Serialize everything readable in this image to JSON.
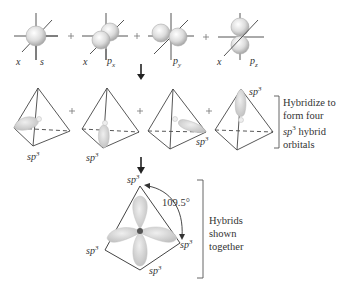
{
  "row1": {
    "orbitals": [
      {
        "axis_label": "x",
        "orbital_label": "s"
      },
      {
        "axis_label": "x",
        "orbital_label": "p",
        "orbital_sub": "x"
      },
      {
        "axis_label": "",
        "orbital_label": "p",
        "orbital_sub": "y"
      },
      {
        "axis_label": "x",
        "orbital_label": "p",
        "orbital_sub": "z"
      }
    ],
    "operator": "+"
  },
  "row2": {
    "hybrid_label": "sp",
    "hybrid_sup": "3",
    "operator": "+",
    "bracket_text": {
      "line1": "Hybridize to",
      "line2": "form four",
      "line3_italic": "sp",
      "line3_sup": "3",
      "line3_rest": " hybrid",
      "line4": "orbitals"
    }
  },
  "row3": {
    "hybrid_label": "sp",
    "hybrid_sup": "3",
    "angle": "109.5°",
    "bracket_text": {
      "line1": "Hybrids",
      "line2": "shown",
      "line3": "together"
    }
  },
  "colors": {
    "line": "#444444",
    "orbital_fill": "#d8d8d8",
    "orbital_edge": "#bbbbbb",
    "nucleus": "#555555"
  }
}
